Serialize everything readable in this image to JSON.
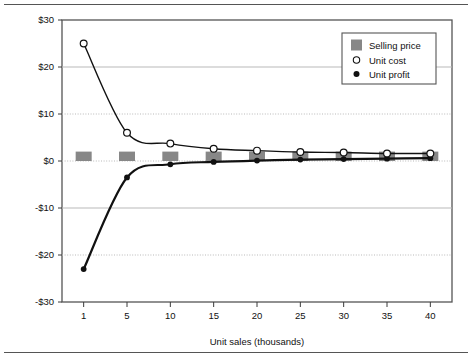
{
  "chart_data": {
    "type": "line",
    "title": "",
    "subtitle": "",
    "xlabel": "Unit sales (thousands)",
    "ylabel": "",
    "categories": [
      "1",
      "5",
      "10",
      "15",
      "20",
      "25",
      "30",
      "35",
      "40"
    ],
    "x": [
      1,
      5,
      10,
      15,
      20,
      25,
      30,
      35,
      40
    ],
    "xtick_labels": [
      "1",
      "5",
      "10",
      "15",
      "20",
      "25",
      "30",
      "35",
      "40"
    ],
    "ytick_labels": [
      "$30",
      "$20",
      "$10",
      "$0",
      "-$10",
      "-$20",
      "-$30"
    ],
    "ytick_values": [
      30,
      20,
      10,
      0,
      -10,
      -20,
      -30
    ],
    "ylim": [
      -30,
      30
    ],
    "grid": true,
    "legend_position": "top-right",
    "series": [
      {
        "name": "Selling price",
        "type": "bar",
        "marker": "square",
        "color": "#878787",
        "values": [
          2,
          2,
          2,
          2,
          2,
          2,
          2,
          2,
          2
        ]
      },
      {
        "name": "Unit cost",
        "type": "line",
        "marker": "open-circle",
        "color": "#111111",
        "values": [
          25,
          6,
          3.7,
          2.6,
          2.2,
          1.9,
          1.8,
          1.6,
          1.6
        ]
      },
      {
        "name": "Unit profit",
        "type": "line",
        "marker": "filled-circle",
        "color": "#111111",
        "values": [
          -23,
          -3.5,
          -0.7,
          -0.2,
          0.1,
          0.3,
          0.4,
          0.5,
          0.6
        ]
      }
    ]
  },
  "legend": {
    "items": [
      {
        "label": "Selling price",
        "marker": "square-swatch"
      },
      {
        "label": "Unit cost",
        "marker": "open-circle"
      },
      {
        "label": "Unit profit",
        "marker": "filled-circle"
      }
    ]
  },
  "colors": {
    "bar_fill": "#878787",
    "line": "#111111",
    "grid": "#b9b9b9",
    "axis": "#3a3a3a",
    "frame": "#555555"
  }
}
